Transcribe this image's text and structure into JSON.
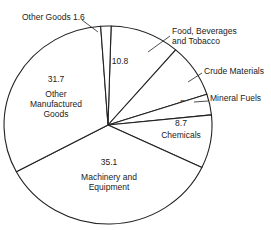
{
  "chart_data": {
    "type": "pie",
    "title": "",
    "unit": "percent",
    "slices": [
      {
        "label": "Food, Beverages and Tobacco",
        "label_lines": [
          "Food, Beverages",
          "and Tobacco"
        ],
        "value": 10.8,
        "value_label": "10.8",
        "label_outside": true
      },
      {
        "label": "Crude Materials",
        "label_lines": [
          "Crude Materials"
        ],
        "value": 8.7,
        "value_label": "8.7",
        "label_outside": true
      },
      {
        "label": "Mineral Fuels",
        "label_lines": [
          "Mineral Fuels"
        ],
        "value": 3.4,
        "value_label": "3.4",
        "label_outside": true
      },
      {
        "label": "Chemicals",
        "label_lines": [
          "Chemicals"
        ],
        "value": 8.7,
        "value_label": "8.7",
        "label_outside": false
      },
      {
        "label": "Machinery and Equipment",
        "label_lines": [
          "Machinery and",
          "Equipment"
        ],
        "value": 35.1,
        "value_label": "35.1",
        "label_outside": false
      },
      {
        "label": "Other Manufactured Goods",
        "label_lines": [
          "Other",
          "Manufactured",
          "Goods"
        ],
        "value": 31.7,
        "value_label": "31.7",
        "label_outside": false
      },
      {
        "label": "Other Goods",
        "label_lines": [
          "Other Goods 1.6"
        ],
        "value": 1.6,
        "value_label": "1.6",
        "label_outside": true
      }
    ],
    "start": "top",
    "direction": "clockwise",
    "legend": "none"
  }
}
